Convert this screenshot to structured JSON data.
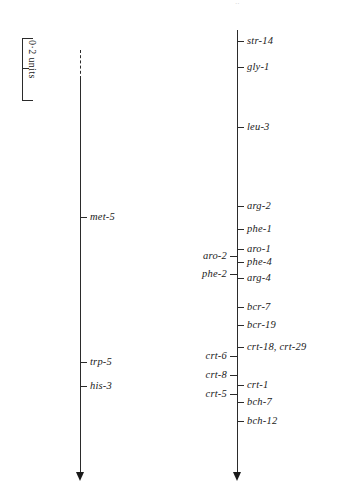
{
  "figure": {
    "type": "genetic-linkage-map",
    "scale_bar": {
      "caption": "0·2 units"
    },
    "top_artifact": "··"
  },
  "chromosomes": [
    {
      "id": "left-linkage-group",
      "name": "left-linkage-group",
      "axis_x": 80,
      "axis_top": 50,
      "axis_bottom": 472,
      "dashed_top": 50,
      "dashed_bottom": 79,
      "loci": [
        {
          "label": "met-5",
          "y": 217,
          "side": "right"
        },
        {
          "label": "trp-5",
          "y": 362,
          "side": "right"
        },
        {
          "label": "his-3",
          "y": 386,
          "side": "right"
        }
      ]
    },
    {
      "id": "right-linkage-group",
      "name": "right-linkage-group",
      "axis_x": 237,
      "axis_top": 30,
      "axis_bottom": 472,
      "dashed_top": null,
      "dashed_bottom": null,
      "loci": [
        {
          "label": "str-14",
          "y": 41,
          "side": "right"
        },
        {
          "label": "gly-1",
          "y": 67,
          "side": "right"
        },
        {
          "label": "leu-3",
          "y": 127,
          "side": "right"
        },
        {
          "label": "arg-2",
          "y": 206,
          "side": "right"
        },
        {
          "label": "phe-1",
          "y": 229,
          "side": "right"
        },
        {
          "label": "aro-1",
          "y": 249,
          "side": "right"
        },
        {
          "label": "aro-2",
          "y": 256,
          "side": "left"
        },
        {
          "label": "phe-4",
          "y": 262,
          "side": "right"
        },
        {
          "label": "phe-2",
          "y": 274,
          "side": "left"
        },
        {
          "label": "arg-4",
          "y": 278,
          "side": "right"
        },
        {
          "label": "bcr-7",
          "y": 307,
          "side": "right"
        },
        {
          "label": "bcr-19",
          "y": 325,
          "side": "right"
        },
        {
          "label": "crt-18, crt-29",
          "y": 347,
          "side": "right"
        },
        {
          "label": "crt-6",
          "y": 356,
          "side": "left"
        },
        {
          "label": "crt-8",
          "y": 375,
          "side": "left"
        },
        {
          "label": "crt-1",
          "y": 385,
          "side": "right"
        },
        {
          "label": "crt-5",
          "y": 394,
          "side": "left"
        },
        {
          "label": "bch-7",
          "y": 402,
          "side": "right"
        },
        {
          "label": "bch-12",
          "y": 421,
          "side": "right"
        }
      ]
    }
  ],
  "colors": {
    "ink": "#2b2b2b",
    "background": "#ffffff"
  }
}
